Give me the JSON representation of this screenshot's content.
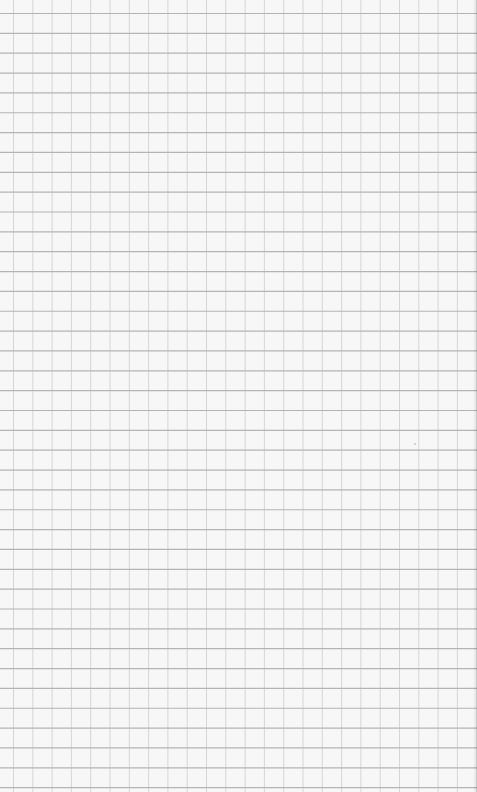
{
  "image": {
    "description": "Blank sheet of grid (graph) paper",
    "width": 477,
    "height": 792
  },
  "grid": {
    "background_color": "#f7f7f7",
    "horizontal_line_color": "#b4b4b4",
    "vertical_line_color": "#d6d6d6",
    "horizontal_spacing_px": 19.85,
    "vertical_spacing_px": 19.3,
    "horizontal_offset_px": 13.5,
    "vertical_offset_px": 13.5,
    "horizontal_line_width": 1.2,
    "vertical_line_width": 1
  },
  "marks": [
    {
      "type": "speck",
      "x": 414,
      "y": 443,
      "color": "#c8c8c8"
    }
  ]
}
